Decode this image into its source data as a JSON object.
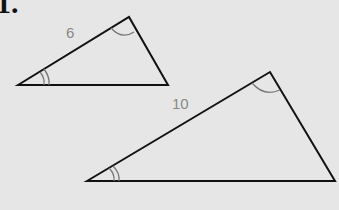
{
  "problem": {
    "number": "1."
  },
  "small_triangle": {
    "side_label": "6",
    "vertices": {
      "left": [
        18,
        85
      ],
      "top": [
        129,
        17
      ],
      "right": [
        168,
        85
      ]
    }
  },
  "large_triangle": {
    "side_label": "10",
    "vertices": {
      "left": [
        87,
        181
      ],
      "top": [
        270,
        72
      ],
      "right": [
        335,
        181
      ]
    }
  },
  "colors": {
    "background": "#e6e6e6",
    "stroke": "#111111",
    "label": "#888888",
    "arc": "#777777"
  }
}
